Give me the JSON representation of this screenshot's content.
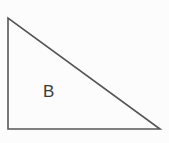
{
  "figure": {
    "kind": "right-triangle-diagram",
    "canvas": {
      "width": 169,
      "height": 143
    },
    "background_color": "#fcfcfc",
    "stroke_color": "#555555",
    "stroke_width": 1.6,
    "fill": "none",
    "label_color": "#3b3b3b",
    "shape": {
      "name": "triangle-b",
      "label": "B",
      "vertices": [
        {
          "name": "apex-top-left",
          "x": 8,
          "y": 18
        },
        {
          "name": "corner-bottom-left",
          "x": 8,
          "y": 129
        },
        {
          "name": "corner-bottom-right",
          "x": 160,
          "y": 129
        }
      ],
      "points_attr": "8,18 8,129 160,129",
      "right_angle_at": "corner-bottom-left",
      "edges": [
        {
          "name": "vertical-leg",
          "from": "apex-top-left",
          "to": "corner-bottom-left",
          "length_px": 111
        },
        {
          "name": "horizontal-leg",
          "from": "corner-bottom-left",
          "to": "corner-bottom-right",
          "length_px": 152
        },
        {
          "name": "hypotenuse",
          "from": "apex-top-left",
          "to": "corner-bottom-right",
          "length_px": 188
        }
      ],
      "label_position": {
        "x": 48,
        "y": 92
      }
    }
  }
}
